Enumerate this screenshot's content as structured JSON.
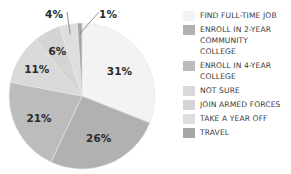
{
  "chart_data": {
    "type": "pie",
    "title": "",
    "categories": [
      "FIND FULL-TIME JOB",
      "ENROLL IN 2-YEAR COMMUNITY COLLEGE",
      "ENROLL IN 4-YEAR COLLEGE",
      "NOT SURE",
      "JOIN ARMED FORCES",
      "TAKE A YEAR OFF",
      "TRAVEL"
    ],
    "values": [
      31,
      26,
      21,
      11,
      6,
      4,
      1
    ],
    "labels": [
      "31%",
      "26%",
      "21%",
      "11%",
      "6%",
      "4%",
      "1%"
    ],
    "colors": [
      "#f3f3f3",
      "#b1b1b1",
      "#bcbcbc",
      "#d9d9d9",
      "#d4d4d4",
      "#dedede",
      "#a6a6a6"
    ],
    "start_angle": "12 o'clock, clockwise",
    "legend_position": "right"
  },
  "legend": {
    "items": [
      {
        "label": "FIND FULL-TIME JOB",
        "color": "#f3f3f3"
      },
      {
        "label": "ENROLL IN 2-YEAR COMMUNITY COLLEGE",
        "color": "#b1b1b1"
      },
      {
        "label": "ENROLL IN 4-YEAR COLLEGE",
        "color": "#bcbcbc"
      },
      {
        "label": "NOT SURE",
        "color": "#d9d9d9"
      },
      {
        "label": "JOIN ARMED FORCES",
        "color": "#d4d4d4"
      },
      {
        "label": "TAKE A YEAR OFF",
        "color": "#dedede"
      },
      {
        "label": "TRAVEL",
        "color": "#a6a6a6"
      }
    ]
  }
}
